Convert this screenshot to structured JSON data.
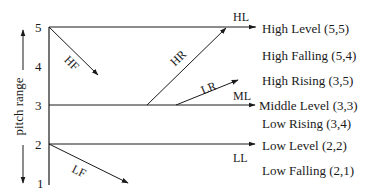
{
  "axis": {
    "label": "pitch range",
    "ticks": [
      "5",
      "4",
      "3",
      "2",
      "1"
    ]
  },
  "contours": [
    {
      "abbr": "HL",
      "name": "High Level (5,5)"
    },
    {
      "abbr": "HF",
      "name": "High Falling (5,4)"
    },
    {
      "abbr": "HR",
      "name": "High Rising (3,5)"
    },
    {
      "abbr": "ML",
      "name": "Middle Level (3,3)"
    },
    {
      "abbr": "LR",
      "name": "Low Rising (3,4)"
    },
    {
      "abbr": "LL",
      "name": "Low Level (2,2)"
    },
    {
      "abbr": "LF",
      "name": "Low Falling (2,1)"
    }
  ],
  "colors": {
    "line": "#1a1a1a",
    "background": "#ffffff"
  }
}
